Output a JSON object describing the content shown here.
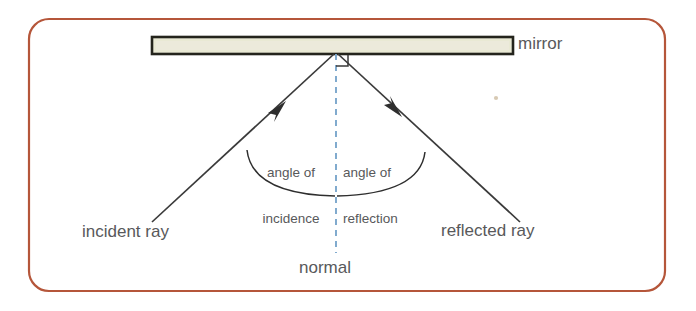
{
  "diagram": {
    "frame": {
      "border_color": "#b5563a",
      "background": "#ffffff",
      "corner_radius": 20
    },
    "mirror": {
      "label": "mirror",
      "fill_color": "#e8e8d2",
      "border_color": "#2b2b22"
    },
    "normal": {
      "label": "normal",
      "color": "#7ba7cc",
      "style": "dashed"
    },
    "rays": {
      "incident": {
        "label": "incident ray",
        "color": "#3a3a3a",
        "arrow_direction": "up-right"
      },
      "reflected": {
        "label": "reflected ray",
        "color": "#3a3a3a",
        "arrow_direction": "down-right"
      }
    },
    "angles": {
      "incidence": {
        "line1": "angle of",
        "line2": "incidence"
      },
      "reflection": {
        "line1": "angle of",
        "line2": "reflection"
      }
    },
    "right_angle_marker": {
      "name": "right-angle-square",
      "color": "#3a3a3a"
    },
    "text_color": "#58595b"
  }
}
